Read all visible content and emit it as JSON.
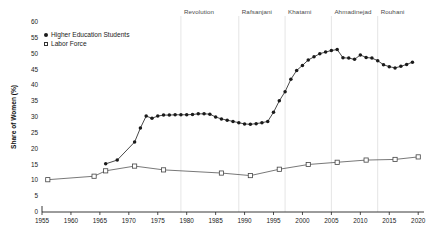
{
  "chart_data": {
    "type": "line",
    "title": "",
    "xlabel": "",
    "ylabel": "Share of Women (%)",
    "xlim": [
      1955,
      2021
    ],
    "ylim": [
      0,
      60
    ],
    "yticks": [
      0,
      5,
      10,
      15,
      20,
      25,
      30,
      35,
      40,
      45,
      50,
      55,
      60
    ],
    "xticks": [
      1955,
      1960,
      1965,
      1970,
      1975,
      1980,
      1985,
      1990,
      1995,
      2000,
      2005,
      2010,
      2015,
      2020
    ],
    "grid": "vertical-era-dividers-only",
    "legend_position": "top-left-inside",
    "series": [
      {
        "name": "Higher Education Students",
        "marker": "filled-circle",
        "color": "#1a1a1a",
        "x": [
          1966,
          1968,
          1971,
          1972,
          1973,
          1974,
          1975,
          1976,
          1977,
          1978,
          1979,
          1980,
          1981,
          1982,
          1983,
          1984,
          1985,
          1986,
          1987,
          1988,
          1989,
          1990,
          1991,
          1992,
          1993,
          1994,
          1995,
          1996,
          1997,
          1998,
          1999,
          2000,
          2001,
          2002,
          2003,
          2004,
          2005,
          2006,
          2007,
          2008,
          2009,
          2010,
          2011,
          2012,
          2013,
          2014,
          2015,
          2016,
          2017,
          2018,
          2019
        ],
        "y": [
          15.2,
          16.4,
          22.1,
          26.5,
          30.3,
          29.6,
          30.3,
          30.6,
          30.6,
          30.7,
          30.7,
          30.7,
          30.8,
          31.0,
          31.0,
          30.9,
          30.0,
          29.4,
          29.0,
          28.6,
          28.2,
          27.8,
          27.7,
          27.9,
          28.2,
          28.6,
          31.5,
          35.1,
          38.0,
          41.9,
          44.7,
          46.3,
          48.0,
          49.0,
          50.0,
          50.5,
          51.0,
          51.3,
          48.7,
          48.6,
          48.2,
          49.6,
          48.8,
          48.6,
          47.8,
          46.5,
          45.9,
          45.5,
          46.0,
          46.6,
          47.3
        ]
      },
      {
        "name": "Labor Force",
        "marker": "open-square",
        "color": "#555555",
        "x": [
          1956,
          1964,
          1966,
          1971,
          1976,
          1986,
          1991,
          1996,
          2001,
          2006,
          2011,
          2016,
          2020
        ],
        "y": [
          10.2,
          11.3,
          13.0,
          14.5,
          13.3,
          12.3,
          11.5,
          13.5,
          15.0,
          15.7,
          16.4,
          16.6,
          17.4
        ]
      }
    ],
    "era_dividers": [
      {
        "label": "Revolution",
        "year": 1979
      },
      {
        "label": "Rafsanjani",
        "year": 1989
      },
      {
        "label": "Khatami",
        "year": 1997
      },
      {
        "label": "Ahmadinejad",
        "year": 2005
      },
      {
        "label": "Rouhani",
        "year": 2013
      }
    ]
  }
}
